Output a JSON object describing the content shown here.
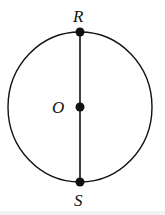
{
  "diagram": {
    "type": "geometry",
    "stroke_color": "#111111",
    "circle": {
      "cx": 80,
      "cy": 107,
      "rx": 72,
      "ry": 75
    },
    "diameter": {
      "from": "R",
      "to": "S"
    },
    "points": [
      {
        "id": "R",
        "label": "R",
        "x": 80,
        "y": 32,
        "label_x": 73,
        "label_y": 22
      },
      {
        "id": "O",
        "label": "O",
        "x": 80,
        "y": 107,
        "label_x": 52,
        "label_y": 113
      },
      {
        "id": "S",
        "label": "S",
        "x": 80,
        "y": 182,
        "label_x": 74,
        "label_y": 206
      }
    ]
  }
}
